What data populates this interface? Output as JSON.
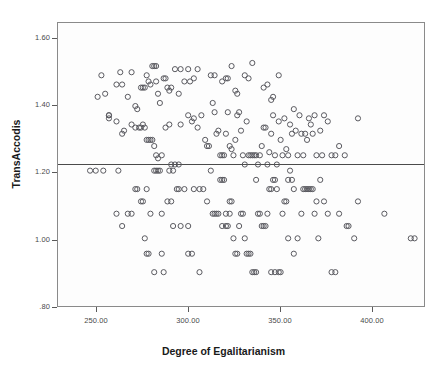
{
  "chart_data": {
    "type": "scatter",
    "title": "",
    "xlabel": "Degree of Egalitarianism",
    "ylabel": "TransAccodis",
    "xlim": [
      231,
      425
    ],
    "ylim": [
      0.74,
      1.66
    ],
    "xticks": [
      250,
      300,
      350,
      400
    ],
    "xtick_labels": [
      "250.00",
      "300.00",
      "350.00",
      "400.00"
    ],
    "yticks": [
      0.8,
      1.0,
      1.2,
      1.4,
      1.6
    ],
    "ytick_labels": [
      ".80",
      "1.00",
      "1.20",
      "1.40",
      "1.60"
    ],
    "grid": false,
    "legend": null,
    "marker": "open-circle",
    "marker_color": "#59595f",
    "background_color": "#fdfdfd",
    "frame_color": "#8a8a8a",
    "annotations": [
      {
        "type": "reference-line",
        "orientation": "horizontal",
        "y": 1.2,
        "color": "#4a4a4a"
      }
    ],
    "points": [
      [
        252,
        1.42
      ],
      [
        254,
        1.49
      ],
      [
        256,
        1.43
      ],
      [
        258,
        1.36
      ],
      [
        258,
        1.35
      ],
      [
        262,
        1.46
      ],
      [
        264,
        1.5
      ],
      [
        265,
        1.46
      ],
      [
        268,
        1.42
      ],
      [
        270,
        1.5
      ],
      [
        272,
        1.39
      ],
      [
        273,
        1.38
      ],
      [
        275,
        1.45
      ],
      [
        276,
        1.45
      ],
      [
        277,
        1.45
      ],
      [
        278,
        1.49
      ],
      [
        279,
        1.47
      ],
      [
        280,
        1.46
      ],
      [
        281,
        1.52
      ],
      [
        282,
        1.52
      ],
      [
        283,
        1.52
      ],
      [
        283,
        1.47
      ],
      [
        284,
        1.43
      ],
      [
        285,
        1.4
      ],
      [
        287,
        1.48
      ],
      [
        288,
        1.48
      ],
      [
        289,
        1.45
      ],
      [
        290,
        1.44
      ],
      [
        291,
        1.45
      ],
      [
        293,
        1.51
      ],
      [
        295,
        1.43
      ],
      [
        296,
        1.51
      ],
      [
        298,
        1.47
      ],
      [
        300,
        1.51
      ],
      [
        301,
        1.47
      ],
      [
        303,
        1.48
      ],
      [
        305,
        1.51
      ],
      [
        312,
        1.49
      ],
      [
        314,
        1.49
      ],
      [
        318,
        1.47
      ],
      [
        320,
        1.48
      ],
      [
        321,
        1.48
      ],
      [
        323,
        1.52
      ],
      [
        325,
        1.44
      ],
      [
        326,
        1.43
      ],
      [
        330,
        1.49
      ],
      [
        332,
        1.48
      ],
      [
        334,
        1.53
      ],
      [
        340,
        1.45
      ],
      [
        342,
        1.46
      ],
      [
        344,
        1.41
      ],
      [
        345,
        1.42
      ],
      [
        348,
        1.49
      ],
      [
        258,
        1.36
      ],
      [
        262,
        1.34
      ],
      [
        265,
        1.3
      ],
      [
        266,
        1.31
      ],
      [
        270,
        1.33
      ],
      [
        272,
        1.32
      ],
      [
        274,
        1.32
      ],
      [
        275,
        1.32
      ],
      [
        276,
        1.33
      ],
      [
        277,
        1.32
      ],
      [
        278,
        1.28
      ],
      [
        279,
        1.28
      ],
      [
        280,
        1.28
      ],
      [
        281,
        1.28
      ],
      [
        282,
        1.26
      ],
      [
        283,
        1.23
      ],
      [
        284,
        1.22
      ],
      [
        286,
        1.23
      ],
      [
        288,
        1.32
      ],
      [
        290,
        1.33
      ],
      [
        291,
        1.2
      ],
      [
        293,
        1.2
      ],
      [
        295,
        1.2
      ],
      [
        296,
        1.33
      ],
      [
        300,
        1.36
      ],
      [
        302,
        1.34
      ],
      [
        303,
        1.35
      ],
      [
        305,
        1.32
      ],
      [
        307,
        1.36
      ],
      [
        309,
        1.28
      ],
      [
        310,
        1.26
      ],
      [
        311,
        1.26
      ],
      [
        313,
        1.4
      ],
      [
        314,
        1.37
      ],
      [
        315,
        1.3
      ],
      [
        316,
        1.31
      ],
      [
        317,
        1.23
      ],
      [
        318,
        1.23
      ],
      [
        319,
        1.23
      ],
      [
        320,
        1.3
      ],
      [
        321,
        1.37
      ],
      [
        322,
        1.26
      ],
      [
        323,
        1.25
      ],
      [
        324,
        1.23
      ],
      [
        325,
        1.28
      ],
      [
        326,
        1.36
      ],
      [
        327,
        1.37
      ],
      [
        328,
        1.31
      ],
      [
        329,
        1.23
      ],
      [
        330,
        1.2
      ],
      [
        331,
        1.34
      ],
      [
        332,
        1.23
      ],
      [
        333,
        1.23
      ],
      [
        334,
        1.23
      ],
      [
        335,
        1.23
      ],
      [
        336,
        1.23
      ],
      [
        337,
        1.2
      ],
      [
        338,
        1.23
      ],
      [
        339,
        1.26
      ],
      [
        340,
        1.32
      ],
      [
        341,
        1.32
      ],
      [
        342,
        1.2
      ],
      [
        343,
        1.24
      ],
      [
        344,
        1.3
      ],
      [
        345,
        1.36
      ],
      [
        346,
        1.23
      ],
      [
        347,
        1.2
      ],
      [
        348,
        1.34
      ],
      [
        349,
        1.28
      ],
      [
        350,
        1.23
      ],
      [
        351,
        1.35
      ],
      [
        352,
        1.25
      ],
      [
        353,
        1.23
      ],
      [
        354,
        1.33
      ],
      [
        355,
        1.3
      ],
      [
        356,
        1.38
      ],
      [
        357,
        1.31
      ],
      [
        358,
        1.23
      ],
      [
        359,
        1.36
      ],
      [
        360,
        1.3
      ],
      [
        361,
        1.23
      ],
      [
        362,
        1.3
      ],
      [
        363,
        1.28
      ],
      [
        364,
        1.35
      ],
      [
        365,
        1.33
      ],
      [
        366,
        1.3
      ],
      [
        367,
        1.36
      ],
      [
        368,
        1.23
      ],
      [
        370,
        1.31
      ],
      [
        371,
        1.23
      ],
      [
        372,
        1.36
      ],
      [
        374,
        1.34
      ],
      [
        376,
        1.23
      ],
      [
        378,
        1.23
      ],
      [
        380,
        1.26
      ],
      [
        383,
        1.23
      ],
      [
        390,
        1.35
      ],
      [
        248,
        1.18
      ],
      [
        251,
        1.18
      ],
      [
        255,
        1.18
      ],
      [
        263,
        1.18
      ],
      [
        272,
        1.12
      ],
      [
        273,
        1.12
      ],
      [
        275,
        1.08
      ],
      [
        276,
        1.08
      ],
      [
        278,
        1.12
      ],
      [
        280,
        1.04
      ],
      [
        282,
        1.18
      ],
      [
        283,
        1.18
      ],
      [
        284,
        1.18
      ],
      [
        285,
        1.18
      ],
      [
        286,
        1.04
      ],
      [
        270,
        1.04
      ],
      [
        268,
        1.04
      ],
      [
        265,
        1.0
      ],
      [
        262,
        1.04
      ],
      [
        277,
        0.96
      ],
      [
        278,
        0.91
      ],
      [
        279,
        0.91
      ],
      [
        282,
        0.85
      ],
      [
        286,
        0.91
      ],
      [
        287,
        0.85
      ],
      [
        290,
        1.18
      ],
      [
        292,
        1.18
      ],
      [
        295,
        1.12
      ],
      [
        300,
        1.0
      ],
      [
        303,
        1.12
      ],
      [
        306,
        1.12
      ],
      [
        308,
        1.12
      ],
      [
        310,
        1.08
      ],
      [
        312,
        1.18
      ],
      [
        313,
        1.04
      ],
      [
        314,
        1.04
      ],
      [
        315,
        1.04
      ],
      [
        316,
        1.04
      ],
      [
        317,
        1.15
      ],
      [
        318,
        1.15
      ],
      [
        319,
        1.15
      ],
      [
        320,
        1.0
      ],
      [
        321,
        1.0
      ],
      [
        322,
        1.08
      ],
      [
        323,
        1.08
      ],
      [
        324,
        0.96
      ],
      [
        325,
        0.91
      ],
      [
        326,
        0.91
      ],
      [
        327,
        1.0
      ],
      [
        328,
        1.04
      ],
      [
        329,
        1.04
      ],
      [
        330,
        0.96
      ],
      [
        331,
        0.91
      ],
      [
        332,
        0.91
      ],
      [
        333,
        0.91
      ],
      [
        334,
        0.85
      ],
      [
        335,
        0.85
      ],
      [
        336,
        0.85
      ],
      [
        337,
        1.04
      ],
      [
        338,
        1.04
      ],
      [
        339,
        1.0
      ],
      [
        340,
        1.0
      ],
      [
        341,
        1.0
      ],
      [
        342,
        1.04
      ],
      [
        343,
        1.12
      ],
      [
        344,
        1.12
      ],
      [
        345,
        1.15
      ],
      [
        346,
        1.15
      ],
      [
        347,
        1.12
      ],
      [
        348,
        0.85
      ],
      [
        349,
        0.85
      ],
      [
        350,
        1.04
      ],
      [
        351,
        1.08
      ],
      [
        352,
        1.08
      ],
      [
        353,
        0.96
      ],
      [
        354,
        1.18
      ],
      [
        355,
        1.15
      ],
      [
        356,
        0.91
      ],
      [
        358,
        0.96
      ],
      [
        360,
        1.04
      ],
      [
        361,
        1.12
      ],
      [
        362,
        1.12
      ],
      [
        363,
        1.12
      ],
      [
        364,
        1.12
      ],
      [
        365,
        1.12
      ],
      [
        366,
        1.12
      ],
      [
        367,
        1.04
      ],
      [
        368,
        1.08
      ],
      [
        369,
        0.96
      ],
      [
        370,
        1.15
      ],
      [
        372,
        1.08
      ],
      [
        374,
        1.04
      ],
      [
        376,
        0.85
      ],
      [
        378,
        0.85
      ],
      [
        380,
        1.04
      ],
      [
        384,
        1.0
      ],
      [
        385,
        1.0
      ],
      [
        388,
        0.96
      ],
      [
        390,
        1.08
      ],
      [
        404,
        1.04
      ],
      [
        418,
        0.96
      ],
      [
        420,
        0.96
      ],
      [
        300,
        0.91
      ],
      [
        306,
        0.85
      ],
      [
        292,
        1.0
      ],
      [
        296,
        1.0
      ],
      [
        289,
        1.08
      ],
      [
        291,
        1.08
      ],
      [
        294,
        1.12
      ],
      [
        298,
        1.12
      ],
      [
        302,
        0.91
      ],
      [
        336,
        1.15
      ],
      [
        353,
        1.15
      ],
      [
        356,
        1.12
      ],
      [
        344,
        0.85
      ],
      [
        346,
        0.85
      ],
      [
        318,
        1.0
      ],
      [
        320,
        1.04
      ],
      [
        322,
        1.04
      ]
    ]
  }
}
